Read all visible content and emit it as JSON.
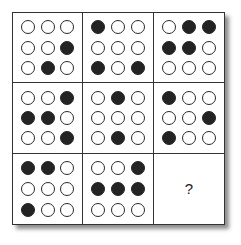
{
  "puzzle": {
    "rows": 3,
    "cols": 3,
    "missing_label": "?",
    "cells": [
      [
        [
          [
            0,
            0,
            0
          ],
          [
            0,
            0,
            1
          ],
          [
            0,
            1,
            0
          ]
        ],
        [
          [
            1,
            0,
            0
          ],
          [
            0,
            0,
            0
          ],
          [
            1,
            0,
            1
          ]
        ],
        [
          [
            0,
            1,
            1
          ],
          [
            1,
            1,
            0
          ],
          [
            0,
            0,
            0
          ]
        ]
      ],
      [
        [
          [
            0,
            0,
            1
          ],
          [
            1,
            1,
            0
          ],
          [
            0,
            0,
            1
          ]
        ],
        [
          [
            0,
            1,
            0
          ],
          [
            0,
            0,
            0
          ],
          [
            0,
            1,
            0
          ]
        ],
        [
          [
            1,
            0,
            0
          ],
          [
            0,
            0,
            1
          ],
          [
            1,
            0,
            0
          ]
        ]
      ],
      [
        [
          [
            1,
            1,
            0
          ],
          [
            0,
            0,
            0
          ],
          [
            1,
            0,
            0
          ]
        ],
        [
          [
            0,
            0,
            1
          ],
          [
            1,
            1,
            1
          ],
          [
            0,
            0,
            0
          ]
        ],
        null
      ]
    ],
    "colors": {
      "filled": "#232323",
      "empty": "#ffffff",
      "border": "#333333"
    }
  }
}
